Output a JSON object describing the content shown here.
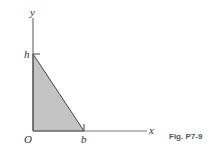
{
  "figure": {
    "caption": "Fig. P7-9",
    "axes": {
      "x_label": "x",
      "y_label": "y",
      "origin_label": "O"
    },
    "points": {
      "h_label": "h",
      "b_label": "b"
    },
    "shape": "right triangle",
    "vertices": [
      "O (0,0)",
      "h (0,h)",
      "b (b,0)"
    ],
    "colors": {
      "fill": "#c4c4c4",
      "stroke": "#444444",
      "axis": "#555555"
    }
  }
}
